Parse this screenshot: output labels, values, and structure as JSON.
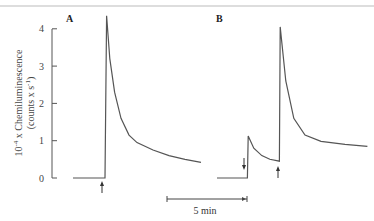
{
  "chart_data": {
    "type": "line",
    "title": "",
    "ylabel_line1": "10",
    "ylabel_exp": "-4",
    "ylabel_rest": " x Chemiluminescence",
    "ylabel_line2": "(counts x s",
    "ylabel_line2_exp": "-1",
    "ylabel_line2_end": ")",
    "xlabel": "",
    "ylim": [
      0,
      4.4
    ],
    "yticks": [
      0,
      1,
      2,
      3,
      4
    ],
    "scale_bar": {
      "label": "5 min",
      "minutes": 5
    },
    "panels": [
      {
        "label": "A",
        "series": [
          {
            "name": "Panel A trace",
            "x_min": [
              0,
              2.0,
              2.1,
              2.3,
              2.6,
              3.0,
              3.5,
              4.0,
              5.0,
              6.0,
              7.0,
              8.0
            ],
            "values": [
              0,
              0,
              4.35,
              3.2,
              2.3,
              1.6,
              1.15,
              0.95,
              0.75,
              0.6,
              0.5,
              0.42
            ]
          }
        ],
        "annotations": [
          {
            "type": "arrow-up",
            "x_min": 2.0,
            "meaning": "stimulus addition"
          }
        ]
      },
      {
        "label": "B",
        "series": [
          {
            "name": "Panel B trace",
            "x_min": [
              0,
              1.9,
              1.95,
              2.3,
              2.8,
              3.3,
              3.9,
              3.95,
              4.3,
              4.8,
              5.5,
              6.5,
              8.0,
              9.4
            ],
            "values": [
              0,
              0,
              1.13,
              0.8,
              0.6,
              0.5,
              0.45,
              4.05,
              2.6,
              1.6,
              1.15,
              0.98,
              0.9,
              0.85
            ]
          }
        ],
        "annotations": [
          {
            "type": "arrow-down",
            "x_min": 1.9,
            "meaning": "first addition"
          },
          {
            "type": "arrow-up",
            "x_min": 3.9,
            "meaning": "second addition"
          }
        ]
      }
    ]
  }
}
